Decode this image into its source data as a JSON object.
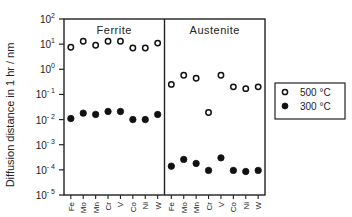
{
  "chart_data": {
    "type": "scatter",
    "title": "",
    "ylabel": "Diffusion distance in 1 hr / nm",
    "xlabel": "",
    "yscale": "log",
    "ylim": [
      1e-05,
      100
    ],
    "y_ticks": [
      "10^2",
      "10^1",
      "10^0",
      "10^-1",
      "10^-2",
      "10^-3",
      "10^-4",
      "10^-5"
    ],
    "grid": false,
    "legend_position": "right",
    "legend": [
      {
        "label": "500 °C",
        "marker": "open-circle"
      },
      {
        "label": "300 °C",
        "marker": "filled-circle"
      }
    ],
    "panels": [
      {
        "name": "Ferrite",
        "categories": [
          "Fe",
          "Mo",
          "Mn",
          "Cr",
          "V",
          "Co",
          "Ni",
          "W"
        ],
        "series": [
          {
            "name": "500 °C",
            "values": [
              7.5,
              13,
              9,
              13,
              13,
              7,
              7,
              11
            ]
          },
          {
            "name": "300 °C",
            "values": [
              0.011,
              0.018,
              0.016,
              0.021,
              0.021,
              0.01,
              0.01,
              0.016
            ]
          }
        ]
      },
      {
        "name": "Austenite",
        "categories": [
          "Fe",
          "Mo",
          "Mn",
          "Cr",
          "V",
          "Co",
          "Ni",
          "W"
        ],
        "series": [
          {
            "name": "500 °C",
            "values": [
              0.25,
              0.58,
              0.44,
              0.019,
              0.58,
              0.2,
              0.17,
              0.2
            ]
          },
          {
            "name": "300 °C",
            "values": [
              0.00014,
              0.00026,
              0.00018,
              9.5e-05,
              0.0003,
              9.5e-05,
              8.6e-05,
              9.5e-05
            ]
          }
        ]
      }
    ]
  }
}
